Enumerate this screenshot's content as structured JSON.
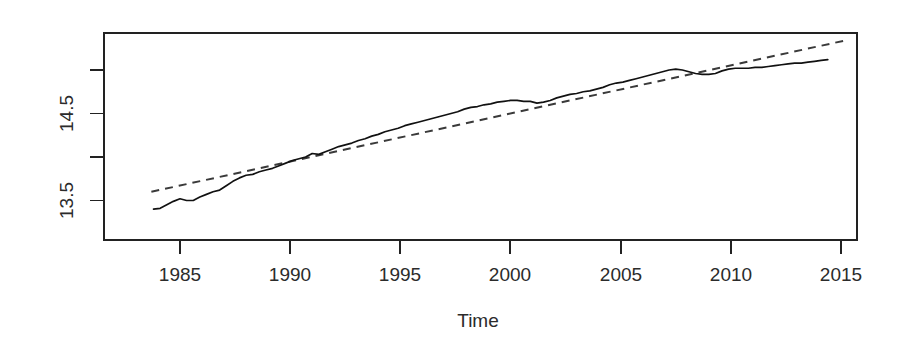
{
  "chart_data": {
    "type": "line",
    "title": "",
    "subtitle": "",
    "xlabel": "Time",
    "ylabel": "",
    "grid": false,
    "legend": "none",
    "xlim": [
      1983.5,
      2015.5
    ],
    "ylim": [
      13.28,
      15.17
    ],
    "xticks": [
      1985,
      1990,
      1995,
      2000,
      2005,
      2010,
      2015
    ],
    "xticklabels": [
      "1985",
      "1990",
      "1995",
      "2000",
      "2005",
      "2010",
      "2015"
    ],
    "yticks": [
      13.5,
      14.0,
      14.5,
      15.0
    ],
    "yticklabels": [
      "13.5",
      "",
      "14.5",
      ""
    ],
    "ytick_labels_shown": [
      "13.5",
      "14.5"
    ],
    "axis_colors": {
      "frame": "#222222",
      "text": "#2b2b2b",
      "background": "#ffffff"
    },
    "series": [
      {
        "name": "observed",
        "style": "solid",
        "color": "#111111",
        "x": [
          1983.8,
          1984.1,
          1984.4,
          1984.7,
          1985.0,
          1985.3,
          1985.6,
          1985.9,
          1986.2,
          1986.5,
          1986.8,
          1987.1,
          1987.4,
          1987.7,
          1988.0,
          1988.3,
          1988.6,
          1988.9,
          1989.2,
          1989.5,
          1989.8,
          1990.1,
          1990.4,
          1990.7,
          1991.0,
          1991.3,
          1991.6,
          1991.9,
          1992.2,
          1992.5,
          1992.8,
          1993.1,
          1993.4,
          1993.7,
          1994.0,
          1994.3,
          1994.6,
          1994.9,
          1995.2,
          1995.5,
          1995.8,
          1996.1,
          1996.4,
          1996.7,
          1997.0,
          1997.3,
          1997.6,
          1997.9,
          1998.2,
          1998.5,
          1998.8,
          1999.1,
          1999.4,
          1999.7,
          2000.0,
          2000.3,
          2000.6,
          2000.9,
          2001.2,
          2001.5,
          2001.8,
          2002.1,
          2002.4,
          2002.7,
          2003.0,
          2003.3,
          2003.6,
          2003.9,
          2004.2,
          2004.5,
          2004.8,
          2005.1,
          2005.4,
          2005.7,
          2006.0,
          2006.3,
          2006.6,
          2006.9,
          2007.2,
          2007.5,
          2007.8,
          2008.1,
          2008.4,
          2008.7,
          2009.0,
          2009.3,
          2009.6,
          2009.9,
          2010.2,
          2010.5,
          2010.8,
          2011.1,
          2011.4,
          2011.7,
          2012.0,
          2012.3,
          2012.6,
          2012.9,
          2013.2,
          2013.5,
          2013.8,
          2014.1,
          2014.4
        ],
        "y": [
          13.4,
          13.41,
          13.45,
          13.49,
          13.52,
          13.5,
          13.5,
          13.54,
          13.57,
          13.6,
          13.62,
          13.67,
          13.72,
          13.76,
          13.79,
          13.8,
          13.83,
          13.85,
          13.87,
          13.9,
          13.93,
          13.96,
          13.98,
          14.0,
          14.04,
          14.03,
          14.06,
          14.09,
          14.12,
          14.14,
          14.16,
          14.19,
          14.21,
          14.24,
          14.26,
          14.29,
          14.31,
          14.33,
          14.36,
          14.38,
          14.4,
          14.42,
          14.44,
          14.46,
          14.48,
          14.5,
          14.52,
          14.55,
          14.57,
          14.58,
          14.6,
          14.61,
          14.63,
          14.64,
          14.65,
          14.65,
          14.64,
          14.64,
          14.62,
          14.63,
          14.65,
          14.68,
          14.7,
          14.72,
          14.73,
          14.75,
          14.76,
          14.78,
          14.8,
          14.83,
          14.85,
          14.86,
          14.88,
          14.9,
          14.92,
          14.94,
          14.96,
          14.98,
          15.0,
          15.01,
          15.0,
          14.98,
          14.96,
          14.95,
          14.95,
          14.96,
          14.99,
          15.01,
          15.02,
          15.02,
          15.02,
          15.03,
          15.03,
          15.04,
          15.05,
          15.06,
          15.07,
          15.08,
          15.08,
          15.09,
          15.1,
          15.11,
          15.12
        ]
      },
      {
        "name": "linear-trend",
        "style": "dashed",
        "color": "#3a3a3a",
        "x": [
          1983.7,
          2015.2
        ],
        "y": [
          13.6,
          15.34
        ]
      }
    ]
  },
  "axis": {
    "x_title": "Time"
  }
}
